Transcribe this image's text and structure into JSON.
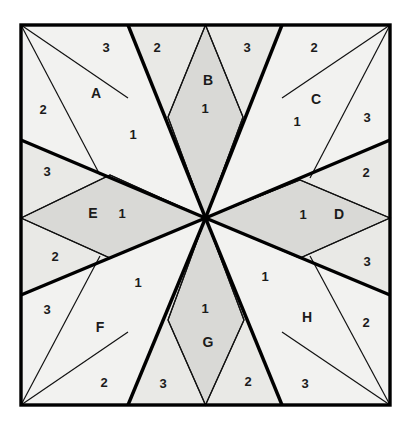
{
  "figure": {
    "name": "eight-point-star-square-tiling",
    "canvas": {
      "width": 404,
      "height": 428
    },
    "square": {
      "left": 21,
      "top": 25,
      "right": 390,
      "bottom": 405
    },
    "center": {
      "x": 205.5,
      "y": 218
    },
    "colors": {
      "background": "#ffffff",
      "fill_light": "#f2f2f0",
      "fill_shaded": "#d9d9d6",
      "fill_mid": "#e9e9e6",
      "stroke_thick": "#000000",
      "stroke_thin": "#111111",
      "label_text": "#1b1b1b"
    },
    "stroke_widths": {
      "border": 3.4,
      "thick": 3.4,
      "thin": 1.2
    }
  },
  "regions": [
    {
      "id": "B",
      "position": "top",
      "shaded": true,
      "points": "205.5,25 243,117 205.5,218 168,117"
    },
    {
      "id": "D",
      "position": "right",
      "shaded": true,
      "points": "390,218 300,258 205.5,218 300,180"
    },
    {
      "id": "G",
      "position": "bottom",
      "shaded": true,
      "points": "205.5,405 168,320 205.5,218 244,320"
    },
    {
      "id": "E",
      "position": "left",
      "shaded": true,
      "points": "21,218 110,175 205.5,218 110,258"
    }
  ],
  "faces": [
    {
      "id": "tl-outer-a",
      "shade": "light",
      "points": "21,25 128,25 205.5,218 21,140"
    },
    {
      "id": "tr-outer-c",
      "shade": "light",
      "points": "282,25 390,25 390,140 205.5,218"
    },
    {
      "id": "br-outer-h",
      "shade": "light",
      "points": "390,295 390,405 282,405 205.5,218"
    },
    {
      "id": "bl-outer-f",
      "shade": "light",
      "points": "21,295 205.5,218 128,405 21,405"
    },
    {
      "id": "wedge-top-left",
      "shade": "mid",
      "points": "128,25 205.5,25 205.5,218"
    },
    {
      "id": "wedge-top-right",
      "shade": "mid",
      "points": "205.5,25 282,25 205.5,218"
    },
    {
      "id": "wedge-right-top",
      "shade": "mid",
      "points": "390,140 390,218 205.5,218"
    },
    {
      "id": "wedge-right-bot",
      "shade": "mid",
      "points": "390,218 390,295 205.5,218"
    },
    {
      "id": "wedge-bot-right",
      "shade": "mid",
      "points": "282,405 205.5,405 205.5,218"
    },
    {
      "id": "wedge-bot-left",
      "shade": "mid",
      "points": "205.5,405 128,405 205.5,218"
    },
    {
      "id": "wedge-left-bot",
      "shade": "mid",
      "points": "21,295 21,218 205.5,218"
    },
    {
      "id": "wedge-left-top",
      "shade": "mid",
      "points": "21,218 21,140 205.5,218"
    }
  ],
  "thick_rays": [
    {
      "from": "center",
      "to_x": 128,
      "to_y": 25
    },
    {
      "from": "center",
      "to_x": 282,
      "to_y": 25
    },
    {
      "from": "center",
      "to_x": 390,
      "to_y": 140
    },
    {
      "from": "center",
      "to_x": 390,
      "to_y": 295
    },
    {
      "from": "center",
      "to_x": 282,
      "to_y": 405
    },
    {
      "from": "center",
      "to_x": 128,
      "to_y": 405
    },
    {
      "from": "center",
      "to_x": 21,
      "to_y": 295
    },
    {
      "from": "center",
      "to_x": 21,
      "to_y": 140
    }
  ],
  "thin_lines": [
    {
      "x1": 205.5,
      "y1": 25,
      "x2": 168,
      "y2": 117
    },
    {
      "x1": 168,
      "y1": 117,
      "x2": 205.5,
      "y2": 218
    },
    {
      "x1": 205.5,
      "y1": 25,
      "x2": 243,
      "y2": 117
    },
    {
      "x1": 243,
      "y1": 117,
      "x2": 205.5,
      "y2": 218
    },
    {
      "x1": 390,
      "y1": 218,
      "x2": 300,
      "y2": 180
    },
    {
      "x1": 300,
      "y1": 180,
      "x2": 205.5,
      "y2": 218
    },
    {
      "x1": 390,
      "y1": 218,
      "x2": 300,
      "y2": 258
    },
    {
      "x1": 300,
      "y1": 258,
      "x2": 205.5,
      "y2": 218
    },
    {
      "x1": 205.5,
      "y1": 405,
      "x2": 168,
      "y2": 320
    },
    {
      "x1": 168,
      "y1": 320,
      "x2": 205.5,
      "y2": 218
    },
    {
      "x1": 205.5,
      "y1": 405,
      "x2": 244,
      "y2": 320
    },
    {
      "x1": 244,
      "y1": 320,
      "x2": 205.5,
      "y2": 218
    },
    {
      "x1": 21,
      "y1": 218,
      "x2": 110,
      "y2": 175
    },
    {
      "x1": 110,
      "y1": 175,
      "x2": 205.5,
      "y2": 218
    },
    {
      "x1": 21,
      "y1": 218,
      "x2": 110,
      "y2": 258
    },
    {
      "x1": 110,
      "y1": 258,
      "x2": 205.5,
      "y2": 218
    },
    {
      "x1": 21,
      "y1": 25,
      "x2": 128,
      "y2": 98
    },
    {
      "x1": 21,
      "y1": 25,
      "x2": 100,
      "y2": 175
    },
    {
      "x1": 390,
      "y1": 25,
      "x2": 282,
      "y2": 98
    },
    {
      "x1": 390,
      "y1": 25,
      "x2": 310,
      "y2": 178
    },
    {
      "x1": 390,
      "y1": 405,
      "x2": 282,
      "y2": 332
    },
    {
      "x1": 390,
      "y1": 405,
      "x2": 310,
      "y2": 256
    },
    {
      "x1": 21,
      "y1": 405,
      "x2": 128,
      "y2": 332
    },
    {
      "x1": 21,
      "y1": 405,
      "x2": 100,
      "y2": 256
    }
  ],
  "labels": [
    {
      "text": "3",
      "kind": "number",
      "x": 106,
      "y": 47,
      "name": "label-3-top-left"
    },
    {
      "text": "2",
      "kind": "number",
      "x": 157,
      "y": 47,
      "name": "label-2-top-left"
    },
    {
      "text": "B",
      "kind": "letter",
      "x": 208,
      "y": 80,
      "name": "label-region-b"
    },
    {
      "text": "3",
      "kind": "number",
      "x": 247,
      "y": 47,
      "name": "label-3-top-right"
    },
    {
      "text": "2",
      "kind": "number",
      "x": 314,
      "y": 47,
      "name": "label-2-top-right"
    },
    {
      "text": "A",
      "kind": "letter",
      "x": 96,
      "y": 93,
      "name": "label-region-a"
    },
    {
      "text": "1",
      "kind": "number",
      "x": 205,
      "y": 108,
      "name": "label-1-b"
    },
    {
      "text": "C",
      "kind": "letter",
      "x": 316,
      "y": 99,
      "name": "label-region-c"
    },
    {
      "text": "2",
      "kind": "number",
      "x": 43,
      "y": 109,
      "name": "label-2-left-upper"
    },
    {
      "text": "1",
      "kind": "number",
      "x": 133,
      "y": 134,
      "name": "label-1-a"
    },
    {
      "text": "1",
      "kind": "number",
      "x": 297,
      "y": 121,
      "name": "label-1-c"
    },
    {
      "text": "3",
      "kind": "number",
      "x": 367,
      "y": 117,
      "name": "label-3-right-upper"
    },
    {
      "text": "3",
      "kind": "number",
      "x": 47,
      "y": 171,
      "name": "label-3-left-upper"
    },
    {
      "text": "2",
      "kind": "number",
      "x": 366,
      "y": 172,
      "name": "label-2-right-upper"
    },
    {
      "text": "E",
      "kind": "letter",
      "x": 93,
      "y": 213,
      "name": "label-region-e"
    },
    {
      "text": "1",
      "kind": "number",
      "x": 122,
      "y": 213,
      "name": "label-1-e"
    },
    {
      "text": "1",
      "kind": "number",
      "x": 303,
      "y": 214,
      "name": "label-1-d"
    },
    {
      "text": "D",
      "kind": "letter",
      "x": 339,
      "y": 214,
      "name": "label-region-d"
    },
    {
      "text": "2",
      "kind": "number",
      "x": 55,
      "y": 256,
      "name": "label-2-left-lower"
    },
    {
      "text": "3",
      "kind": "number",
      "x": 367,
      "y": 261,
      "name": "label-3-right-lower"
    },
    {
      "text": "1",
      "kind": "number",
      "x": 138,
      "y": 282,
      "name": "label-1-f"
    },
    {
      "text": "1",
      "kind": "number",
      "x": 265,
      "y": 276,
      "name": "label-1-h"
    },
    {
      "text": "3",
      "kind": "number",
      "x": 47,
      "y": 309,
      "name": "label-3-left-lower"
    },
    {
      "text": "1",
      "kind": "number",
      "x": 205,
      "y": 308,
      "name": "label-1-g"
    },
    {
      "text": "H",
      "kind": "letter",
      "x": 307,
      "y": 317,
      "name": "label-region-h"
    },
    {
      "text": "2",
      "kind": "number",
      "x": 366,
      "y": 322,
      "name": "label-2-right-lower"
    },
    {
      "text": "F",
      "kind": "letter",
      "x": 100,
      "y": 327,
      "name": "label-region-f"
    },
    {
      "text": "G",
      "kind": "letter",
      "x": 208,
      "y": 342,
      "name": "label-region-g"
    },
    {
      "text": "2",
      "kind": "number",
      "x": 104,
      "y": 382,
      "name": "label-2-bottom-left"
    },
    {
      "text": "3",
      "kind": "number",
      "x": 163,
      "y": 383,
      "name": "label-3-bottom-left"
    },
    {
      "text": "2",
      "kind": "number",
      "x": 248,
      "y": 381,
      "name": "label-2-bottom-right"
    },
    {
      "text": "3",
      "kind": "number",
      "x": 305,
      "y": 383,
      "name": "label-3-bottom-right"
    }
  ]
}
